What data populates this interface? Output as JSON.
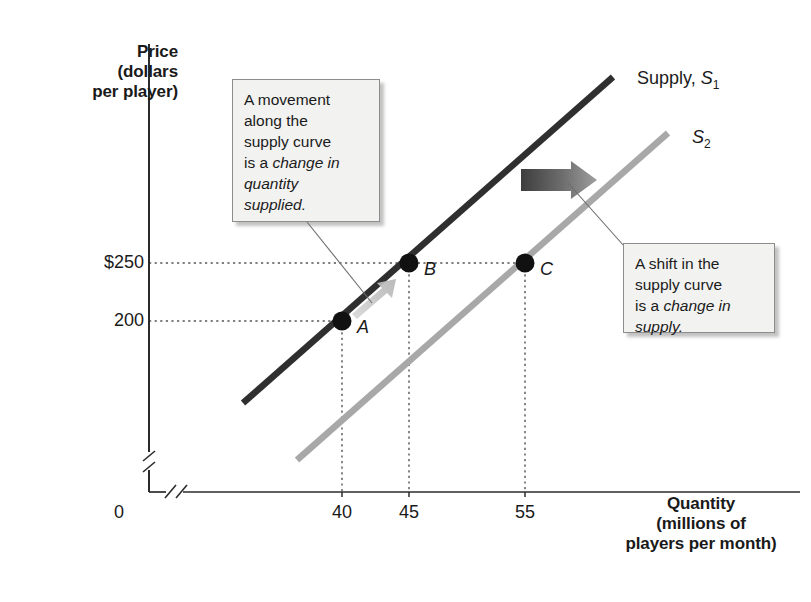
{
  "figure": {
    "title_present": false,
    "axes": {
      "y_title": "Price\n(dollars\nper player)",
      "x_title": "Quantity\n(millions of\nplayers per month)",
      "origin_label": "0",
      "y_ticks": [
        {
          "label": "$250",
          "value": 250
        },
        {
          "label": "200",
          "value": 200
        }
      ],
      "x_ticks": [
        {
          "label": "40",
          "value": 40
        },
        {
          "label": "45",
          "value": 45
        },
        {
          "label": "55",
          "value": 55
        }
      ],
      "axis_break": true
    },
    "curves": [
      {
        "name": "supply-1",
        "label_prefix": "Supply, ",
        "label_symbol": "S",
        "label_subscript": "1",
        "color": "#2f2f2f"
      },
      {
        "name": "supply-2",
        "label_prefix": "",
        "label_symbol": "S",
        "label_subscript": "2",
        "color": "#a8a8a8"
      }
    ],
    "points": [
      {
        "id": "A",
        "label": "A",
        "price": 200,
        "quantity": 40,
        "on_curve": "supply-1"
      },
      {
        "id": "B",
        "label": "B",
        "price": 250,
        "quantity": 45,
        "on_curve": "supply-1"
      },
      {
        "id": "C",
        "label": "C",
        "price": 250,
        "quantity": 55,
        "on_curve": "supply-2"
      }
    ],
    "callouts": [
      {
        "name": "movement-callout",
        "line1": "A movement",
        "line2": "along the",
        "line3": "supply curve",
        "line4_plain": "is a ",
        "line4_italic": "change in",
        "line5_italic": "quantity",
        "line6_italic": "supplied."
      },
      {
        "name": "shift-callout",
        "line1": "A shift in the",
        "line2": "supply curve",
        "line3_plain": "is a ",
        "line3_italic": "change in",
        "line4_italic": "supply."
      }
    ],
    "annotations": [
      {
        "name": "movement-arrow",
        "type": "arrow-along-curve",
        "from_point": "A",
        "to_point": "B",
        "color": "#c6c6c6"
      },
      {
        "name": "shift-arrow",
        "type": "horizontal-arrow",
        "direction": "right",
        "color_start": "#4a4a4a",
        "color_end": "#9a9a9a"
      }
    ]
  },
  "chart_data": {
    "type": "line",
    "title": "",
    "xlabel": "Quantity (millions of players per month)",
    "ylabel": "Price (dollars per player)",
    "xlim": [
      30,
      70
    ],
    "ylim": [
      100,
      400
    ],
    "grid": false,
    "legend": "inline-curve-labels",
    "xticks": [
      40,
      45,
      55
    ],
    "yticks": [
      200,
      250
    ],
    "series": [
      {
        "name": "Supply, S1",
        "color": "#2f2f2f",
        "x": [
          34.5,
          40,
          45,
          63.5
        ],
        "y": [
          145,
          200,
          250,
          440
        ]
      },
      {
        "name": "S2",
        "color": "#a8a8a8",
        "x": [
          43.5,
          55,
          68
        ],
        "y": [
          145,
          250,
          385
        ]
      }
    ],
    "markers": [
      {
        "label": "A",
        "x": 40,
        "y": 200
      },
      {
        "label": "B",
        "x": 45,
        "y": 250
      },
      {
        "label": "C",
        "x": 55,
        "y": 250
      }
    ],
    "annotations": [
      "A movement along the supply curve is a change in quantity supplied.",
      "A shift in the supply curve is a change in supply."
    ]
  }
}
